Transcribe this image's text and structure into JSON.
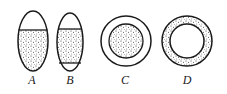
{
  "figure": {
    "colors": {
      "ink": "#1a1a1a",
      "background": "#ffffff",
      "stipple": "#333333"
    },
    "shapes": [
      {
        "id": "A",
        "label": "A",
        "kind": "ellipse",
        "description": "lower portion stippled, upper cap clear"
      },
      {
        "id": "B",
        "label": "B",
        "kind": "ellipse",
        "description": "middle band stippled, top and bottom caps clear"
      },
      {
        "id": "C",
        "label": "C",
        "kind": "circle",
        "description": "inner disc stippled, outer ring clear"
      },
      {
        "id": "D",
        "label": "D",
        "kind": "circle",
        "description": "outer ring stippled, inner disc clear"
      }
    ]
  }
}
